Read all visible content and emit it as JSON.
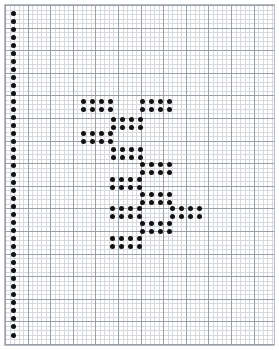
{
  "page": {
    "width": 279,
    "height": 350,
    "background_color": "#ffffff"
  },
  "grid": {
    "name": "graph-paper",
    "minor_cell_px": 4.52,
    "major_cell_px": 22.6,
    "minor_line_color": "#d6d9de",
    "major_line_color": "#9aa0a8",
    "border_color": "#b9bcc2",
    "origin_x": 4,
    "origin_y": 4,
    "grid_width": 271,
    "grid_height": 342
  },
  "dots": {
    "color": "#111111",
    "diameter_px": 5,
    "column_spacing_px": 9.3,
    "row_spacing_px": 8.0
  },
  "margin_column": {
    "label": "left-margin-dot-column",
    "x": 13,
    "y_start": 13,
    "y_step": 8.05,
    "count": 41
  },
  "chart_data": {
    "type": "scatter",
    "title": "",
    "xlabel": "",
    "ylabel": "",
    "grid": true,
    "legend": null,
    "block_width_dots": 4,
    "block_height_dots": 2,
    "dot_dx": 9.3,
    "dot_dy": 8.0,
    "blocks": [
      {
        "name": "block-1",
        "x": 83,
        "y": 101
      },
      {
        "name": "block-2",
        "x": 142,
        "y": 101
      },
      {
        "name": "block-3",
        "x": 113,
        "y": 119
      },
      {
        "name": "block-4",
        "x": 83,
        "y": 133
      },
      {
        "name": "block-5",
        "x": 113,
        "y": 149
      },
      {
        "name": "block-6",
        "x": 142,
        "y": 164
      },
      {
        "name": "block-7",
        "x": 112,
        "y": 179
      },
      {
        "name": "block-8",
        "x": 142,
        "y": 194
      },
      {
        "name": "block-9",
        "x": 112,
        "y": 208
      },
      {
        "name": "block-10",
        "x": 172,
        "y": 208
      },
      {
        "name": "block-11",
        "x": 142,
        "y": 223
      },
      {
        "name": "block-12",
        "x": 112,
        "y": 238
      }
    ]
  }
}
